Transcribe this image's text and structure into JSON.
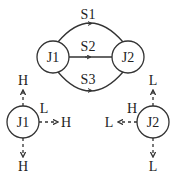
{
  "top_graph": {
    "nodes": [
      {
        "id": "J1",
        "label": "J1"
      },
      {
        "id": "J2",
        "label": "J2"
      }
    ],
    "edges": [
      {
        "id": "S1",
        "label": "S1",
        "from": "J1",
        "to": "J2",
        "shape": "upper-arc"
      },
      {
        "id": "S2",
        "label": "S2",
        "from": "J1",
        "to": "J2",
        "shape": "straight"
      },
      {
        "id": "S3",
        "label": "S3",
        "from": "J1",
        "to": "J2",
        "shape": "lower-arc"
      }
    ]
  },
  "bottom_left": {
    "node": "J1",
    "arrows": [
      {
        "direction": "up",
        "label": "H"
      },
      {
        "direction": "right",
        "label": "H",
        "port_label": "L"
      },
      {
        "direction": "down",
        "label": "H"
      }
    ]
  },
  "bottom_right": {
    "node": "J2",
    "arrows": [
      {
        "direction": "up",
        "label": "L"
      },
      {
        "direction": "left",
        "label": "L",
        "port_label": "H"
      },
      {
        "direction": "down",
        "label": "L"
      }
    ]
  }
}
